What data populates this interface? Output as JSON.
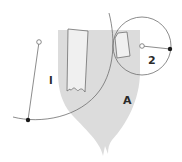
{
  "diagram": {
    "labels": {
      "region_one": "I",
      "region_two": "2",
      "shape_a": "A"
    },
    "colors": {
      "shield_fill": "#dcdcdc",
      "inner_fill": "#eeeeee",
      "stroke": "#6e6e6e",
      "dot_fill": "#1a1a1a",
      "text": "#2a2a2a"
    },
    "elements": [
      {
        "name": "shield-shape",
        "label": "A"
      },
      {
        "name": "arc-one",
        "label": "I",
        "center_marker": "hollow-dot",
        "edge_marker": "filled-dot"
      },
      {
        "name": "circle-two",
        "label": "2",
        "center_marker": "hollow-dot",
        "edge_marker": "filled-dot"
      }
    ]
  }
}
